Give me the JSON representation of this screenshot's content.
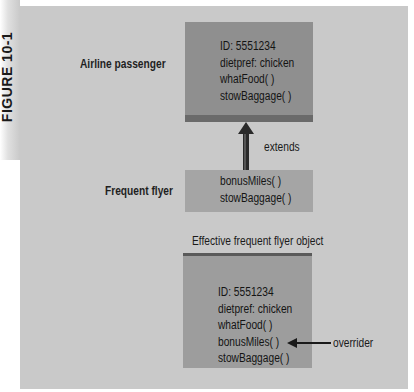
{
  "figure": {
    "label": "FIGURE 10-1"
  },
  "diagram": {
    "classes": [
      {
        "label": "Airline passenger",
        "members": [
          "ID: 5551234",
          "dietpref: chicken",
          "whatFood( )",
          "stowBaggage( )"
        ]
      },
      {
        "label": "Frequent flyer",
        "members": [
          "bonusMiles( )",
          "stowBaggage( )"
        ]
      }
    ],
    "relationship": {
      "label": "extends",
      "from": "Frequent flyer",
      "to": "Airline passenger"
    },
    "effective_object": {
      "caption": "Effective frequent flyer object",
      "members": [
        "ID: 5551234",
        "dietpref: chicken",
        "whatFood( )",
        "bonusMiles( )",
        "stowBaggage( )"
      ],
      "annotation": {
        "label": "overrider",
        "target": "stowBaggage( )"
      }
    },
    "colors": {
      "background": "#c9c9c9",
      "parent_box": "#8f8f8f",
      "parent_box_shadow": "#6a6a6a",
      "child_box": "#a5a5a5",
      "effective_box": "#9d9d9d",
      "arrow": "#2a2a2a",
      "text": "#141414"
    }
  }
}
